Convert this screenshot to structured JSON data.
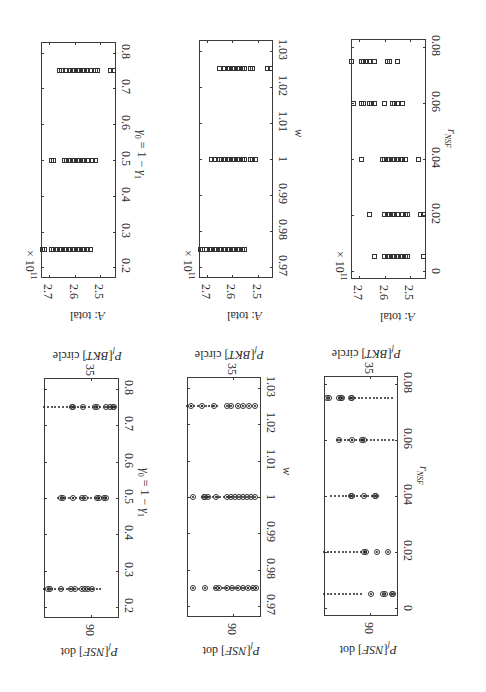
{
  "figure": {
    "orientation": "rotated 90 degrees clockwise",
    "rows": 2,
    "cols": 3
  },
  "chart_data": [
    {
      "id": "atotal_gamma",
      "type": "scatter",
      "marker": "square",
      "xlabel": "γ0 = 1 − γ1",
      "ylabel": "A: total",
      "y_multiplier": "× 10^11",
      "x_ticks": [
        "0.2",
        "0.3",
        "0.4",
        "0.5",
        "0.6",
        "0.7",
        "0.8"
      ],
      "y_ticks": [
        "2.7",
        "2.6",
        "2.5"
      ],
      "xlim": [
        0.17,
        0.83
      ],
      "ylim": [
        2.44,
        2.73
      ],
      "series": [
        {
          "x": 0.25,
          "y": [
            2.725,
            2.715,
            2.69,
            2.68,
            2.67,
            2.66,
            2.65,
            2.64,
            2.63,
            2.62,
            2.61,
            2.6,
            2.59,
            2.58,
            2.57,
            2.56,
            2.55,
            2.54
          ]
        },
        {
          "x": 0.5,
          "y": [
            2.69,
            2.68,
            2.64,
            2.63,
            2.62,
            2.61,
            2.6,
            2.59,
            2.58,
            2.57,
            2.56,
            2.55,
            2.53,
            2.52
          ]
        },
        {
          "x": 0.75,
          "y": [
            2.66,
            2.65,
            2.63,
            2.62,
            2.61,
            2.6,
            2.59,
            2.58,
            2.57,
            2.56,
            2.55,
            2.54,
            2.52,
            2.51,
            2.46,
            2.45
          ]
        }
      ]
    },
    {
      "id": "atotal_w",
      "type": "scatter",
      "marker": "square",
      "xlabel": "w",
      "ylabel": "A: total",
      "y_multiplier": "× 10^11",
      "x_ticks": [
        "0.97",
        "0.98",
        "0.99",
        "1",
        "1.01",
        "1.02",
        "1.03"
      ],
      "y_ticks": [
        "2.7",
        "2.6",
        "2.5"
      ],
      "xlim": [
        0.967,
        1.033
      ],
      "ylim": [
        2.44,
        2.73
      ],
      "series": [
        {
          "x": 0.975,
          "y": [
            2.725,
            2.715,
            2.7,
            2.69,
            2.68,
            2.67,
            2.66,
            2.65,
            2.64,
            2.63,
            2.62,
            2.61,
            2.6,
            2.59,
            2.58,
            2.57,
            2.56,
            2.55
          ]
        },
        {
          "x": 1.0,
          "y": [
            2.68,
            2.67,
            2.65,
            2.64,
            2.63,
            2.62,
            2.61,
            2.6,
            2.59,
            2.58,
            2.57,
            2.56,
            2.55,
            2.53,
            2.52,
            2.51
          ]
        },
        {
          "x": 1.025,
          "y": [
            2.65,
            2.63,
            2.62,
            2.61,
            2.6,
            2.59,
            2.58,
            2.57,
            2.56,
            2.55,
            2.53,
            2.52,
            2.46,
            2.45
          ]
        }
      ]
    },
    {
      "id": "atotal_rnsf",
      "type": "scatter",
      "marker": "square",
      "xlabel": "rNSF",
      "ylabel": "A: total",
      "y_multiplier": "× 10^11",
      "x_ticks": [
        "0",
        "0.02",
        "0.04",
        "0.06",
        "0.08"
      ],
      "y_ticks": [
        "2.7",
        "2.6",
        "2.5"
      ],
      "xlim": [
        -0.003,
        0.083
      ],
      "ylim": [
        2.44,
        2.73
      ],
      "series": [
        {
          "x": 0.005,
          "y": [
            2.64,
            2.6,
            2.59,
            2.58,
            2.57,
            2.56,
            2.55,
            2.54,
            2.53,
            2.52,
            2.51,
            2.45
          ]
        },
        {
          "x": 0.02,
          "y": [
            2.66,
            2.6,
            2.59,
            2.58,
            2.57,
            2.56,
            2.55,
            2.53,
            2.52,
            2.51,
            2.46,
            2.45
          ]
        },
        {
          "x": 0.04,
          "y": [
            2.69,
            2.61,
            2.6,
            2.59,
            2.58,
            2.57,
            2.56,
            2.55,
            2.54,
            2.53,
            2.52,
            2.47
          ]
        },
        {
          "x": 0.06,
          "y": [
            2.72,
            2.69,
            2.68,
            2.66,
            2.65,
            2.64,
            2.6,
            2.57,
            2.56,
            2.55,
            2.53
          ]
        },
        {
          "x": 0.075,
          "y": [
            2.73,
            2.69,
            2.68,
            2.67,
            2.66,
            2.64,
            2.59,
            2.58,
            2.55
          ]
        }
      ]
    },
    {
      "id": "pf_gamma",
      "type": "scatter",
      "marker": "circle with dot",
      "xlabel": "γ0 = 1 − γ1",
      "ylabel_left": "Pf[NSF] dot",
      "ylabel_right": "Pf[BKT] circle",
      "x_ticks": [
        "0.2",
        "0.3",
        "0.4",
        "0.5",
        "0.6",
        "0.7",
        "0.8"
      ],
      "y_ticks_left": [
        "90"
      ],
      "y_ticks_right": [
        "35"
      ],
      "xlim": [
        0.17,
        0.83
      ],
      "series": [
        {
          "x": 0.25,
          "circle_pos": [
            0.02,
            0.05,
            0.2,
            0.35,
            0.4,
            0.5,
            0.55,
            0.6,
            0.65
          ],
          "dot_range": [
            0.0,
            0.78
          ]
        },
        {
          "x": 0.5,
          "circle_pos": [
            0.2,
            0.23,
            0.38,
            0.5,
            0.55,
            0.72,
            0.76,
            0.82,
            0.85
          ],
          "dot_range": [
            0.18,
            0.85
          ]
        },
        {
          "x": 0.75,
          "circle_pos": [
            0.36,
            0.38,
            0.52,
            0.7,
            0.73,
            0.86,
            0.92,
            0.95,
            0.97
          ],
          "dot_range": [
            0.0,
            0.97
          ]
        }
      ]
    },
    {
      "id": "pf_w",
      "type": "scatter",
      "marker": "circle with dot",
      "xlabel": "w",
      "ylabel_left": "Pf[NSF] dot",
      "ylabel_right": "Pf[BKT] circle",
      "x_ticks": [
        "0.97",
        "0.98",
        "0.99",
        "1",
        "1.01",
        "1.02",
        "1.03"
      ],
      "y_ticks_left": [
        "90"
      ],
      "y_ticks_right": [
        "35"
      ],
      "xlim": [
        0.967,
        1.033
      ],
      "series": [
        {
          "x": 0.975,
          "circle_pos": [
            0.04,
            0.22,
            0.38,
            0.43,
            0.55,
            0.62,
            0.7,
            0.78,
            0.85,
            0.93,
            0.97
          ],
          "dot_range": [
            0.38,
            0.97
          ]
        },
        {
          "x": 1.0,
          "circle_pos": [
            0.04,
            0.2,
            0.22,
            0.26,
            0.38,
            0.55,
            0.6,
            0.66,
            0.72,
            0.78,
            0.84,
            0.9,
            0.96
          ],
          "dot_range": [
            0.2,
            0.6
          ]
        },
        {
          "x": 1.025,
          "circle_pos": [
            0.02,
            0.18,
            0.36,
            0.55,
            0.6,
            0.7,
            0.78,
            0.87,
            0.96
          ],
          "dot_range": [
            0.0,
            0.4
          ]
        }
      ]
    },
    {
      "id": "pf_rnsf",
      "type": "scatter",
      "marker": "circle with dot",
      "xlabel": "rNSF",
      "ylabel_left": "Pf[NSF] dot",
      "ylabel_right": "Pf[BKT] circle",
      "x_ticks": [
        "0",
        "0.02",
        "0.04",
        "0.06",
        "0.08"
      ],
      "y_ticks_left": [
        "90"
      ],
      "y_ticks_right": [
        "35"
      ],
      "xlim": [
        -0.003,
        0.083
      ],
      "series": [
        {
          "x": 0.005,
          "circle_pos": [
            0.65,
            0.82,
            0.85,
            0.95,
            0.97
          ],
          "dot_range": [
            0.0,
            0.5
          ]
        },
        {
          "x": 0.02,
          "circle_pos": [
            0.55,
            0.57,
            0.73,
            0.9
          ],
          "dot_range": [
            0.0,
            0.55
          ]
        },
        {
          "x": 0.04,
          "circle_pos": [
            0.35,
            0.37,
            0.55,
            0.7,
            0.72
          ],
          "dot_range": [
            0.1,
            0.72
          ]
        },
        {
          "x": 0.06,
          "circle_pos": [
            0.18,
            0.37,
            0.52,
            0.54
          ],
          "dot_range": [
            0.18,
            0.97
          ]
        },
        {
          "x": 0.075,
          "circle_pos": [
            0.0,
            0.03,
            0.18,
            0.2,
            0.22,
            0.35,
            0.37
          ],
          "dot_range": [
            0.37,
            0.97
          ]
        }
      ]
    }
  ],
  "labels": {
    "atotal": "A: total",
    "multiplier_base": "× 10",
    "multiplier_exp": "11",
    "pf_nsf": "Pf[NSF] dot",
    "pf_bkt": "Pf[BKT] circle",
    "tick_90": "90",
    "tick_35": "35",
    "xlabel_gamma": "γ0 = 1 − γ1",
    "xlabel_w": "w",
    "xlabel_rnsf": "rNSF"
  }
}
